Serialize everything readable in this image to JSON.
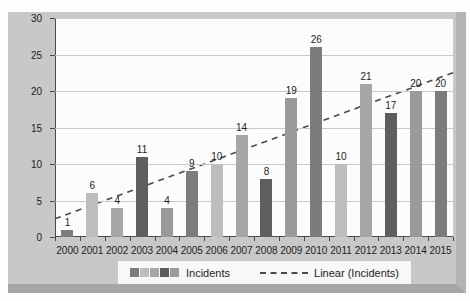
{
  "chart_data": {
    "type": "bar",
    "title": "",
    "categories": [
      "2000",
      "2001",
      "2002",
      "2003",
      "2004",
      "2005",
      "2006",
      "2007",
      "2008",
      "2009",
      "2010",
      "2011",
      "2012",
      "2013",
      "2014",
      "2015"
    ],
    "series": [
      {
        "name": "Incidents",
        "values": [
          1,
          6,
          4,
          11,
          4,
          9,
          10,
          14,
          8,
          19,
          26,
          10,
          21,
          17,
          20,
          20
        ]
      }
    ],
    "data_labels": true,
    "xlabel": "",
    "ylabel": "",
    "ylim": [
      0,
      30
    ],
    "yticks": [
      0,
      5,
      10,
      15,
      20,
      25,
      30
    ],
    "grid": true,
    "legend_position": "bottom",
    "trendline": {
      "name": "Linear (Incidents)",
      "type": "linear",
      "start_value": 2.5,
      "end_value": 22.5
    }
  },
  "legend": {
    "incidents_label": "Incidents",
    "linear_label": "Linear (Incidents)"
  },
  "colors": {
    "bar_cycle": [
      "#7c7c7c",
      "#bdbdbd",
      "#a6a6a6",
      "#5e5e5e",
      "#9a9a9a"
    ],
    "chart_bg": "#c8c8c8",
    "plot_bg": "#fcfcfc",
    "gridline": "#c9c9c9",
    "axis": "#4a4a4a",
    "trendline": "#4a4a4a",
    "text": "#1c1c1c",
    "legend_bg": "#f8f8f8"
  }
}
